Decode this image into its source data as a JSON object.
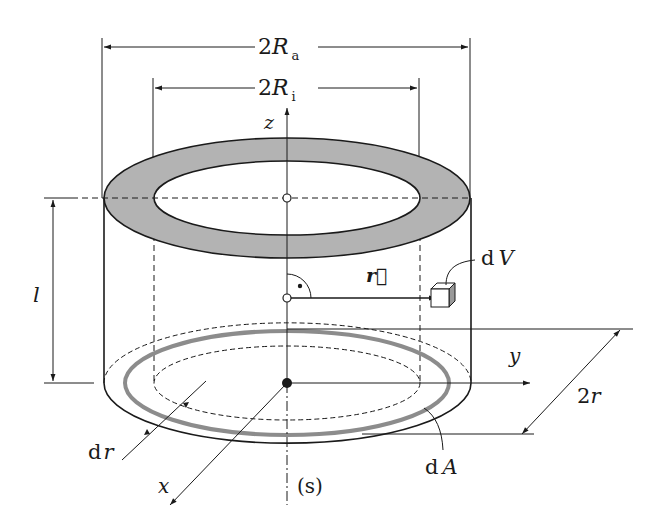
{
  "diagram": {
    "colors": {
      "line": "#1a1a1a",
      "ring_fill": "#b3b3b3",
      "ring_stroke_dA": "#8c8c8c",
      "background": "#ffffff"
    },
    "labels": {
      "outer_diameter_prefix": "2",
      "outer_diameter_var": "R",
      "outer_diameter_sub": "a",
      "inner_diameter_prefix": "2",
      "inner_diameter_var": "R",
      "inner_diameter_sub": "i",
      "axis_z": "z",
      "axis_y": "y",
      "axis_x": "x",
      "length": "l",
      "position_vector": "r⃗",
      "volume_element_d": "d",
      "volume_element_var": "V",
      "area_element_d": "d",
      "area_element_var": "A",
      "ring_width_d": "d",
      "ring_width_var": "r",
      "ring_diameter_prefix": "2",
      "ring_diameter_var": "r",
      "centroid_axis": "(s)"
    }
  }
}
